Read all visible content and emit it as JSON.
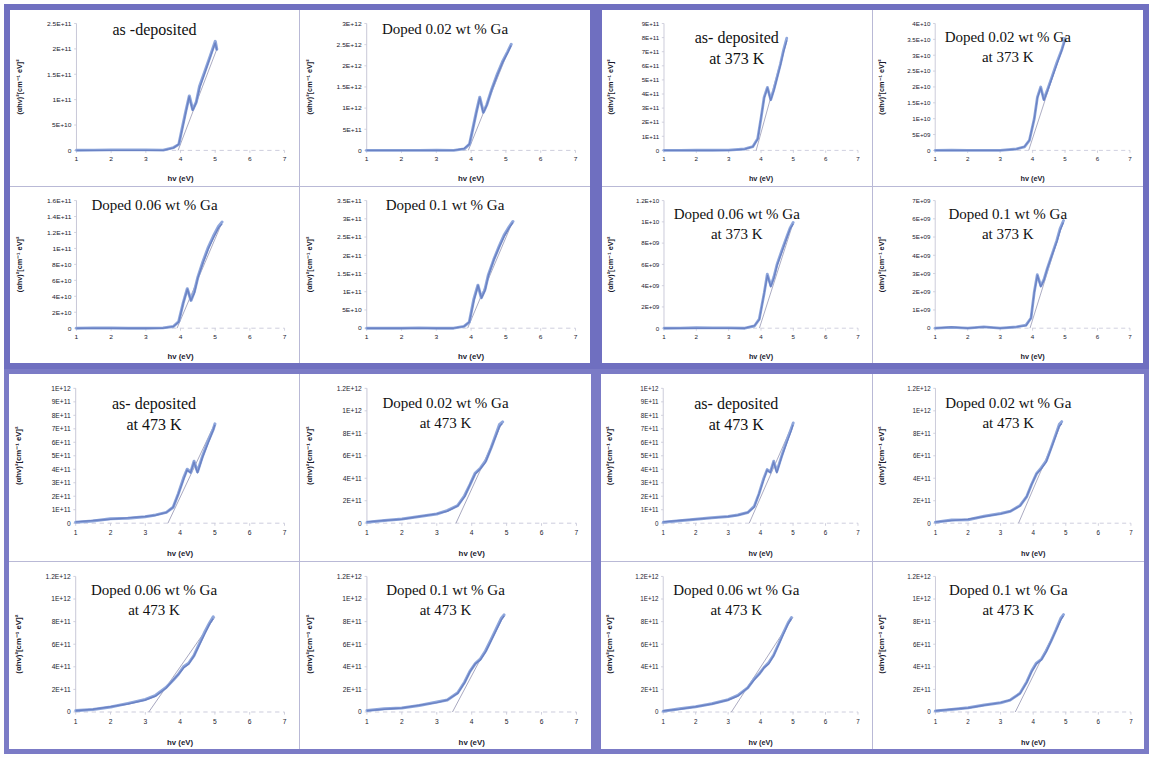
{
  "figure": {
    "kind": "tauc-plot-panel-grid",
    "axis_x_label": "hv (eV)",
    "axis_y_label": "(αhv)²[cm⁻¹ eV]²",
    "frame_color": "#6f6fc0",
    "curve_color": "#8fa7dc",
    "x_ticks": [
      "1",
      "2",
      "3",
      "4",
      "5",
      "6",
      "7"
    ],
    "xlim": [
      1,
      7
    ]
  },
  "chart_data": [
    {
      "id": "q1-p1",
      "type": "line",
      "quadrant": 1,
      "position": "top-left",
      "title": "as -deposited",
      "subtitle": "",
      "xlabel": "hv (eV)",
      "ylabel": "(αhv)²[cm⁻¹ eV]²",
      "xlim": [
        1,
        7
      ],
      "ylim": [
        0,
        250000000000.0
      ],
      "grid": false,
      "legend": "none",
      "y_ticks": [
        "0",
        "5E+10",
        "1E+11",
        "1.5E+11",
        "2E+11",
        "2.5E+11"
      ],
      "x": [
        1.0,
        1.5,
        2.0,
        2.5,
        3.0,
        3.5,
        3.8,
        3.95,
        4.05,
        4.15,
        4.25,
        4.35,
        4.45,
        4.55,
        4.7,
        4.85,
        5.0,
        5.05
      ],
      "y": [
        0,
        0,
        0,
        0,
        0,
        0,
        0.02,
        0.05,
        0.17,
        0.3,
        0.43,
        0.32,
        0.38,
        0.5,
        0.62,
        0.74,
        0.86,
        0.8
      ],
      "y_scale": 250000000000.0,
      "tangent": {
        "x0": 3.93,
        "x1": 5.05
      }
    },
    {
      "id": "q1-p2",
      "type": "line",
      "quadrant": 1,
      "position": "top-right",
      "title": "Doped 0.02 wt % Ga",
      "subtitle": "",
      "xlabel": "hv (eV)",
      "ylabel": "(αhv)²[cm⁻¹ eV]²",
      "xlim": [
        1,
        7
      ],
      "ylim": [
        0,
        3000000000000.0
      ],
      "grid": false,
      "legend": "none",
      "y_ticks": [
        "0",
        "5E+11",
        "1E+12",
        "1.5E+12",
        "2E+12",
        "2.5E+12",
        "3E+12"
      ],
      "x": [
        1.0,
        1.5,
        2.0,
        2.5,
        3.0,
        3.5,
        3.8,
        3.95,
        4.05,
        4.15,
        4.25,
        4.35,
        4.45,
        4.6,
        4.75,
        4.9,
        5.05,
        5.15
      ],
      "y": [
        0,
        0,
        0,
        0,
        0,
        0,
        0.015,
        0.05,
        0.17,
        0.3,
        0.42,
        0.3,
        0.36,
        0.49,
        0.6,
        0.7,
        0.78,
        0.84
      ],
      "y_scale": 3000000000000.0,
      "tangent": {
        "x0": 3.92,
        "x1": 5.15
      }
    },
    {
      "id": "q1-p3",
      "type": "line",
      "quadrant": 1,
      "position": "bottom-left",
      "title": "Doped 0.06 wt % Ga",
      "subtitle": "",
      "xlabel": "hv (eV)",
      "ylabel": "(αhv)²[cm⁻¹ eV]²",
      "xlim": [
        1,
        7
      ],
      "ylim": [
        0,
        160000000000.0
      ],
      "grid": false,
      "legend": "none",
      "y_ticks": [
        "0",
        "2E+10",
        "4E+10",
        "6E+10",
        "8E+10",
        "1E+11",
        "1.2E+11",
        "1.4E+11",
        "1.6E+11"
      ],
      "x": [
        1.0,
        1.5,
        2.0,
        2.5,
        3.0,
        3.5,
        3.8,
        3.95,
        4.08,
        4.2,
        4.3,
        4.4,
        4.5,
        4.65,
        4.8,
        4.95,
        5.1,
        5.2
      ],
      "y": [
        0,
        0,
        0,
        0,
        0,
        0,
        0.015,
        0.05,
        0.2,
        0.31,
        0.22,
        0.28,
        0.4,
        0.52,
        0.63,
        0.72,
        0.8,
        0.83
      ],
      "y_scale": 160000000000.0,
      "tangent": {
        "x0": 3.9,
        "x1": 5.2
      }
    },
    {
      "id": "q1-p4",
      "type": "line",
      "quadrant": 1,
      "position": "bottom-right",
      "title": "Doped 0.1 wt % Ga",
      "subtitle": "",
      "xlabel": "hv (eV)",
      "ylabel": "(αhv)²[cm⁻¹ eV]²",
      "xlim": [
        1,
        7
      ],
      "ylim": [
        0,
        350000000000.0
      ],
      "grid": false,
      "legend": "none",
      "y_ticks": [
        "0",
        "5E+10",
        "1E+11",
        "1.5E+11",
        "2E+11",
        "2.5E+11",
        "3E+11",
        "3.5E+11"
      ],
      "x": [
        1.0,
        1.5,
        2.0,
        2.5,
        3.0,
        3.5,
        3.8,
        3.95,
        4.08,
        4.2,
        4.3,
        4.4,
        4.5,
        4.65,
        4.8,
        4.95,
        5.1,
        5.2
      ],
      "y": [
        0,
        0,
        0,
        0,
        0,
        0,
        0.015,
        0.05,
        0.22,
        0.34,
        0.24,
        0.3,
        0.42,
        0.54,
        0.64,
        0.73,
        0.8,
        0.84
      ],
      "y_scale": 350000000000.0,
      "tangent": {
        "x0": 3.9,
        "x1": 5.2
      }
    },
    {
      "id": "q2-p1",
      "type": "line",
      "quadrant": 2,
      "position": "top-left",
      "title": "as- deposited",
      "subtitle": "at 373 K",
      "xlabel": "hv (eV)",
      "ylabel": "(αhv)²[cm⁻¹ eV]²",
      "xlim": [
        1,
        7
      ],
      "ylim": [
        0,
        900000000000.0
      ],
      "grid": false,
      "legend": "none",
      "y_ticks": [
        "0",
        "1E+11",
        "2E+11",
        "3E+11",
        "4E+11",
        "5E+11",
        "6E+11",
        "7E+11",
        "8E+11",
        "9E+11"
      ],
      "x": [
        1.0,
        1.5,
        2.0,
        2.5,
        3.0,
        3.5,
        3.75,
        3.9,
        4.0,
        4.1,
        4.2,
        4.3,
        4.4,
        4.5,
        4.6,
        4.7,
        4.8
      ],
      "y": [
        0,
        0,
        0,
        0,
        0,
        0.01,
        0.03,
        0.09,
        0.26,
        0.42,
        0.5,
        0.4,
        0.48,
        0.58,
        0.68,
        0.79,
        0.88
      ],
      "y_scale": 900000000000.0,
      "tangent": {
        "x0": 3.85,
        "x1": 4.8
      }
    },
    {
      "id": "q2-p2",
      "type": "line",
      "quadrant": 2,
      "position": "top-right",
      "title": "Doped 0.02 wt % Ga",
      "subtitle": "at 373 K",
      "xlabel": "hv (eV)",
      "ylabel": "(αhv)²[cm⁻¹ eV]²",
      "xlim": [
        1,
        7
      ],
      "ylim": [
        0,
        40000000000.0
      ],
      "grid": false,
      "legend": "none",
      "y_ticks": [
        "0",
        "5E+09",
        "1E+10",
        "1.5E+10",
        "2E+10",
        "2.5E+10",
        "3E+10",
        "3.5E+10",
        "4E+10"
      ],
      "x": [
        1.0,
        1.5,
        2.0,
        2.5,
        3.0,
        3.5,
        3.75,
        3.9,
        4.05,
        4.15,
        4.25,
        4.35,
        4.45,
        4.6,
        4.75,
        4.9,
        5.0
      ],
      "y": [
        0,
        0,
        0,
        0,
        0,
        0.01,
        0.03,
        0.08,
        0.25,
        0.42,
        0.5,
        0.4,
        0.47,
        0.58,
        0.69,
        0.8,
        0.88
      ],
      "y_scale": 40000000000.0,
      "tangent": {
        "x0": 3.88,
        "x1": 5.0
      }
    },
    {
      "id": "q2-p3",
      "type": "line",
      "quadrant": 2,
      "position": "bottom-left",
      "title": "Doped 0.06 wt % Ga",
      "subtitle": "at 373 K",
      "xlabel": "hv (eV)",
      "ylabel": "(αhv)²[cm⁻¹ eV]²",
      "xlim": [
        1,
        7
      ],
      "ylim": [
        0,
        12000000000.0
      ],
      "grid": false,
      "legend": "none",
      "y_ticks": [
        "0",
        "2E+09",
        "4E+09",
        "6E+09",
        "8E+09",
        "1E+10",
        "1.2E+10"
      ],
      "x": [
        1.0,
        1.5,
        2.0,
        2.5,
        3.0,
        3.5,
        3.8,
        3.95,
        4.1,
        4.2,
        4.3,
        4.4,
        4.5,
        4.65,
        4.8,
        4.9,
        5.0
      ],
      "y": [
        0,
        0,
        0,
        0,
        0,
        0,
        0.02,
        0.07,
        0.28,
        0.42,
        0.33,
        0.4,
        0.5,
        0.61,
        0.72,
        0.79,
        0.83
      ],
      "y_scale": 12000000000.0,
      "tangent": {
        "x0": 3.95,
        "x1": 5.0
      }
    },
    {
      "id": "q2-p4",
      "type": "line",
      "quadrant": 2,
      "position": "bottom-right",
      "title": "Doped 0.1 wt % Ga",
      "subtitle": "at 373 K",
      "xlabel": "hv (eV)",
      "ylabel": "(αhv)²[cm⁻¹ eV]²",
      "xlim": [
        1,
        7
      ],
      "ylim": [
        0,
        7000000000.0
      ],
      "grid": false,
      "legend": "none",
      "y_ticks": [
        "0",
        "1E+09",
        "2E+09",
        "3E+09",
        "4E+09",
        "5E+09",
        "6E+09",
        "7E+09"
      ],
      "x": [
        1.0,
        1.5,
        2.0,
        2.5,
        3.0,
        3.5,
        3.8,
        3.95,
        4.05,
        4.15,
        4.25,
        4.35,
        4.45,
        4.6,
        4.75,
        4.85,
        4.95
      ],
      "y": [
        0,
        0.01,
        0,
        0.01,
        0,
        0.01,
        0.02,
        0.08,
        0.28,
        0.42,
        0.33,
        0.38,
        0.47,
        0.58,
        0.69,
        0.78,
        0.84
      ],
      "y_scale": 7000000000.0,
      "tangent": {
        "x0": 3.92,
        "x1": 4.95
      }
    },
    {
      "id": "q3-p1",
      "type": "line",
      "quadrant": 3,
      "position": "top-left",
      "title": "as- deposited",
      "subtitle": "at 473 K",
      "xlabel": "hv (eV)",
      "ylabel": "(αhv)²[cm⁻¹ eV]²",
      "xlim": [
        1,
        7
      ],
      "ylim": [
        0,
        1000000000000.0
      ],
      "grid": false,
      "legend": "none",
      "y_ticks": [
        "0",
        "1E+11",
        "2E+11",
        "3E+11",
        "4E+11",
        "5E+11",
        "6E+11",
        "7E+11",
        "8E+11",
        "9E+11",
        "1E+12"
      ],
      "x": [
        1.0,
        1.5,
        2.0,
        2.5,
        3.0,
        3.3,
        3.6,
        3.8,
        3.95,
        4.1,
        4.2,
        4.3,
        4.4,
        4.5,
        4.65,
        4.8,
        4.95,
        5.0
      ],
      "y": [
        0.01,
        0.02,
        0.03,
        0.04,
        0.05,
        0.06,
        0.08,
        0.12,
        0.22,
        0.33,
        0.4,
        0.38,
        0.46,
        0.38,
        0.5,
        0.6,
        0.7,
        0.74
      ],
      "y_scale": 1000000000000.0,
      "tangent": {
        "x0": 3.65,
        "x1": 5.0
      }
    },
    {
      "id": "q3-p2",
      "type": "line",
      "quadrant": 3,
      "position": "top-right",
      "title": "Doped 0.02 wt % Ga",
      "subtitle": "at 473 K",
      "xlabel": "hv (eV)",
      "ylabel": "(αhv)²[cm⁻¹ eV]²",
      "xlim": [
        1,
        7
      ],
      "ylim": [
        0,
        1200000000000.0
      ],
      "grid": false,
      "legend": "none",
      "y_ticks": [
        "0",
        "2E+11",
        "4E+11",
        "6E+11",
        "8E+11",
        "1E+12",
        "1.2E+12"
      ],
      "x": [
        1.0,
        1.5,
        2.0,
        2.5,
        3.0,
        3.3,
        3.6,
        3.8,
        3.95,
        4.1,
        4.25,
        4.4,
        4.55,
        4.7,
        4.8,
        4.88
      ],
      "y": [
        0.01,
        0.02,
        0.03,
        0.05,
        0.07,
        0.09,
        0.13,
        0.2,
        0.29,
        0.37,
        0.41,
        0.46,
        0.56,
        0.66,
        0.73,
        0.75
      ],
      "y_scale": 1200000000000.0,
      "tangent": {
        "x0": 3.55,
        "x1": 4.88
      }
    },
    {
      "id": "q3-p3",
      "type": "line",
      "quadrant": 3,
      "position": "bottom-left",
      "title": "Doped 0.06 wt % Ga",
      "subtitle": "at 473 K",
      "xlabel": "hv (eV)",
      "ylabel": "(αhv)²[cm⁻¹ eV]²",
      "xlim": [
        1,
        7
      ],
      "ylim": [
        0,
        1200000000000.0
      ],
      "grid": false,
      "legend": "none",
      "y_ticks": [
        "0",
        "2E+11",
        "4E+11",
        "6E+11",
        "8E+11",
        "1E+12",
        "1.2E+12"
      ],
      "x": [
        1.0,
        1.5,
        2.0,
        2.5,
        3.0,
        3.3,
        3.6,
        3.8,
        3.95,
        4.1,
        4.25,
        4.4,
        4.55,
        4.7,
        4.85,
        4.95
      ],
      "y": [
        0.01,
        0.02,
        0.04,
        0.06,
        0.09,
        0.12,
        0.18,
        0.24,
        0.28,
        0.33,
        0.36,
        0.42,
        0.5,
        0.58,
        0.66,
        0.7
      ],
      "y_scale": 1200000000000.0,
      "tangent": {
        "x0": 3.1,
        "x1": 5.0
      }
    },
    {
      "id": "q3-p4",
      "type": "line",
      "quadrant": 3,
      "position": "bottom-right",
      "title": "Doped 0.1 wt % Ga",
      "subtitle": "at 473 K",
      "xlabel": "hv (eV)",
      "ylabel": "(αhv)²[cm⁻¹ eV]²",
      "xlim": [
        1,
        7
      ],
      "ylim": [
        0,
        1200000000000.0
      ],
      "grid": false,
      "legend": "none",
      "y_ticks": [
        "0",
        "2E+11",
        "4E+11",
        "6E+11",
        "8E+11",
        "1E+12",
        "1.2E+12"
      ],
      "x": [
        1.0,
        1.5,
        2.0,
        2.5,
        3.0,
        3.3,
        3.6,
        3.8,
        3.95,
        4.1,
        4.25,
        4.4,
        4.55,
        4.7,
        4.85,
        4.93
      ],
      "y": [
        0.01,
        0.02,
        0.03,
        0.05,
        0.07,
        0.09,
        0.14,
        0.22,
        0.3,
        0.36,
        0.39,
        0.45,
        0.53,
        0.61,
        0.69,
        0.72
      ],
      "y_scale": 1200000000000.0,
      "tangent": {
        "x0": 3.45,
        "x1": 4.93
      }
    },
    {
      "id": "q4-p1",
      "type": "line",
      "quadrant": 4,
      "position": "top-left",
      "title": "as- deposited",
      "subtitle": "at 473 K",
      "xlabel": "hv (eV)",
      "ylabel": "(αhv)²[cm⁻¹ eV]²",
      "xlim": [
        1,
        7
      ],
      "ylim": [
        0,
        1000000000000.0
      ],
      "grid": false,
      "legend": "none",
      "y_ticks": [
        "0",
        "1E+11",
        "2E+11",
        "3E+11",
        "4E+11",
        "5E+11",
        "6E+11",
        "7E+11",
        "8E+11",
        "9E+11",
        "1E+12"
      ],
      "x": [
        1.0,
        1.5,
        2.0,
        2.5,
        3.0,
        3.3,
        3.6,
        3.8,
        3.95,
        4.1,
        4.2,
        4.3,
        4.4,
        4.5,
        4.65,
        4.8,
        4.95,
        5.0
      ],
      "y": [
        0.01,
        0.02,
        0.03,
        0.04,
        0.05,
        0.06,
        0.08,
        0.12,
        0.22,
        0.33,
        0.4,
        0.38,
        0.46,
        0.38,
        0.5,
        0.6,
        0.7,
        0.74
      ],
      "y_scale": 1000000000000.0,
      "tangent": {
        "x0": 3.65,
        "x1": 5.0
      }
    },
    {
      "id": "q4-p2",
      "type": "line",
      "quadrant": 4,
      "position": "top-right",
      "title": "Doped 0.02 wt % Ga",
      "subtitle": "at 473 K",
      "xlabel": "hv (eV)",
      "ylabel": "(αhv)²[cm⁻¹ eV]²",
      "xlim": [
        1,
        7
      ],
      "ylim": [
        0,
        1200000000000.0
      ],
      "grid": false,
      "legend": "none",
      "y_ticks": [
        "0",
        "2E+11",
        "4E+11",
        "6E+11",
        "8E+11",
        "1E+12",
        "1.2E+12"
      ],
      "x": [
        1.0,
        1.5,
        2.0,
        2.5,
        3.0,
        3.3,
        3.6,
        3.8,
        3.95,
        4.1,
        4.25,
        4.4,
        4.55,
        4.7,
        4.8,
        4.88
      ],
      "y": [
        0.01,
        0.02,
        0.03,
        0.05,
        0.07,
        0.09,
        0.13,
        0.2,
        0.29,
        0.37,
        0.41,
        0.46,
        0.56,
        0.66,
        0.73,
        0.75
      ],
      "y_scale": 1200000000000.0,
      "tangent": {
        "x0": 3.55,
        "x1": 4.88
      }
    },
    {
      "id": "q4-p3",
      "type": "line",
      "quadrant": 4,
      "position": "bottom-left",
      "title": "Doped 0.06 wt % Ga",
      "subtitle": "at 473 K",
      "xlabel": "hv (eV)",
      "ylabel": "(αhv)²[cm⁻¹ eV]²",
      "xlim": [
        1,
        7
      ],
      "ylim": [
        0,
        1200000000000.0
      ],
      "grid": false,
      "legend": "none",
      "y_ticks": [
        "0",
        "2E+11",
        "4E+11",
        "6E+11",
        "8E+11",
        "1E+12",
        "1.2E+12"
      ],
      "x": [
        1.0,
        1.5,
        2.0,
        2.5,
        3.0,
        3.3,
        3.6,
        3.8,
        3.95,
        4.1,
        4.25,
        4.4,
        4.55,
        4.7,
        4.85,
        4.95
      ],
      "y": [
        0.01,
        0.02,
        0.04,
        0.06,
        0.09,
        0.12,
        0.18,
        0.24,
        0.28,
        0.33,
        0.36,
        0.42,
        0.5,
        0.58,
        0.66,
        0.7
      ],
      "y_scale": 1200000000000.0,
      "tangent": {
        "x0": 3.1,
        "x1": 5.0
      }
    },
    {
      "id": "q4-p4",
      "type": "line",
      "quadrant": 4,
      "position": "bottom-right",
      "title": "Doped 0.1 wt % Ga",
      "subtitle": "at 473 K",
      "xlabel": "hv (eV)",
      "ylabel": "(αhv)²[cm⁻¹ eV]²",
      "xlim": [
        1,
        7
      ],
      "ylim": [
        0,
        1200000000000.0
      ],
      "grid": false,
      "legend": "none",
      "y_ticks": [
        "0",
        "2E+11",
        "4E+11",
        "6E+11",
        "8E+11",
        "1E+12",
        "1.2E+12"
      ],
      "x": [
        1.0,
        1.5,
        2.0,
        2.5,
        3.0,
        3.3,
        3.6,
        3.8,
        3.95,
        4.1,
        4.25,
        4.4,
        4.55,
        4.7,
        4.85,
        4.93
      ],
      "y": [
        0.01,
        0.02,
        0.03,
        0.05,
        0.07,
        0.09,
        0.14,
        0.22,
        0.3,
        0.36,
        0.39,
        0.45,
        0.53,
        0.61,
        0.69,
        0.72
      ],
      "y_scale": 1200000000000.0,
      "tangent": {
        "x0": 3.45,
        "x1": 4.93
      }
    }
  ]
}
